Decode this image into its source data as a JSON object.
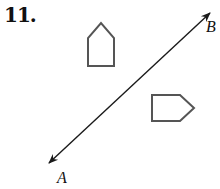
{
  "problem_number": "11.",
  "line": {
    "start_label": "A",
    "end_label": "B",
    "color": "#1a1a1a"
  },
  "figures": [
    {
      "name": "upper-pentagon",
      "orientation": "pointing up",
      "stroke": "#555555"
    },
    {
      "name": "lower-pentagon",
      "orientation": "pointing right",
      "stroke": "#555555"
    }
  ]
}
